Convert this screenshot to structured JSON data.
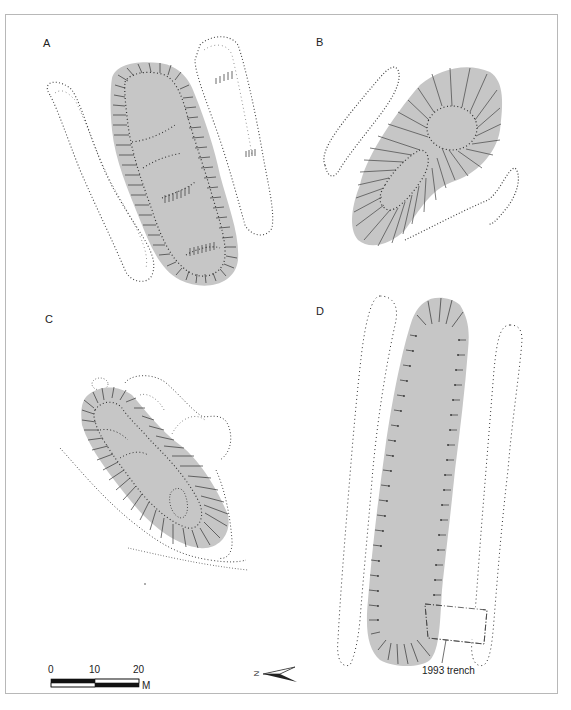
{
  "figure": {
    "panels": [
      {
        "id": "A",
        "label": "A"
      },
      {
        "id": "B",
        "label": "B"
      },
      {
        "id": "C",
        "label": "C"
      },
      {
        "id": "D",
        "label": "D"
      }
    ],
    "annotation": {
      "trench_label": "1993 trench"
    },
    "scale_bar": {
      "ticks": [
        "0",
        "10",
        "20"
      ],
      "unit": "M"
    },
    "north_arrow": {
      "label": "N"
    },
    "colors": {
      "mound_fill": "#c6c6c6",
      "hachure": "#333333",
      "frame": "#b8b8b8"
    }
  }
}
